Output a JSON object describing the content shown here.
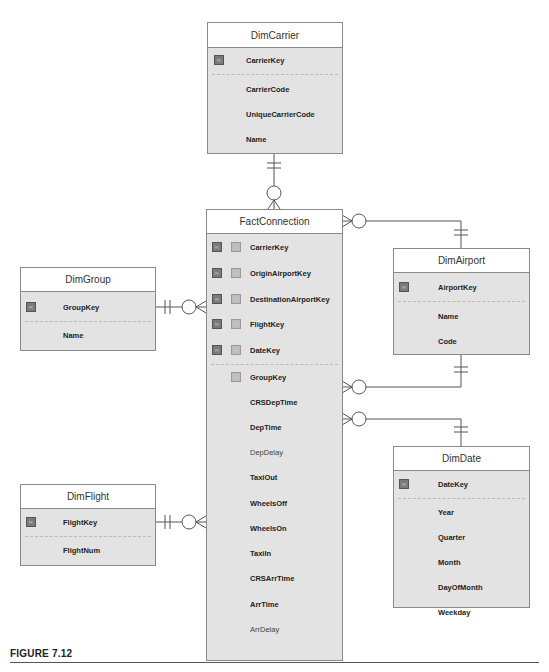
{
  "entities": {
    "dimcarrier": {
      "title": "DimCarrier",
      "fields": [
        {
          "name": "CarrierKey",
          "badge": "PK"
        },
        {
          "name": "CarrierCode"
        },
        {
          "name": "UniqueCarrierCode"
        },
        {
          "name": "Name"
        }
      ]
    },
    "factconnection": {
      "title": "FactConnection",
      "fields": [
        {
          "name": "CarrierKey",
          "badges": [
            "PK",
            "FK"
          ]
        },
        {
          "name": "OriginAirportKey",
          "badges": [
            "PK",
            "FK"
          ]
        },
        {
          "name": "DestinationAirportKey",
          "badges": [
            "PK",
            "FK"
          ]
        },
        {
          "name": "FlightKey",
          "badges": [
            "PK",
            "FK"
          ]
        },
        {
          "name": "DateKey",
          "badges": [
            "PK",
            "FK"
          ]
        },
        {
          "name": "GroupKey",
          "badges": [
            "FK"
          ]
        },
        {
          "name": "CRSDepTime"
        },
        {
          "name": "DepTime"
        },
        {
          "name": "DepDelay"
        },
        {
          "name": "TaxiOut"
        },
        {
          "name": "WheelsOff"
        },
        {
          "name": "WheelsOn"
        },
        {
          "name": "TaxiIn"
        },
        {
          "name": "CRSArrTime"
        },
        {
          "name": "ArrTime"
        },
        {
          "name": "ArrDelay"
        }
      ]
    },
    "dimgroup": {
      "title": "DimGroup",
      "fields": [
        {
          "name": "GroupKey",
          "badge": "PK"
        },
        {
          "name": "Name"
        }
      ]
    },
    "dimflight": {
      "title": "DimFlight",
      "fields": [
        {
          "name": "FlightKey",
          "badge": "PK"
        },
        {
          "name": "FlightNum"
        }
      ]
    },
    "dimairport": {
      "title": "DimAirport",
      "fields": [
        {
          "name": "AirportKey",
          "badge": "PK"
        },
        {
          "name": "Name"
        },
        {
          "name": "Code"
        }
      ]
    },
    "dimdate": {
      "title": "DimDate",
      "fields": [
        {
          "name": "DateKey",
          "badge": "PK"
        },
        {
          "name": "Year"
        },
        {
          "name": "Quarter"
        },
        {
          "name": "Month"
        },
        {
          "name": "DayOfMonth"
        },
        {
          "name": "Weekday"
        }
      ]
    }
  },
  "relationships": [
    {
      "from": "DimCarrier",
      "to": "FactConnection",
      "cardinality": "one-and-only-one to zero-or-many"
    },
    {
      "from": "DimGroup",
      "to": "FactConnection",
      "cardinality": "one-and-only-one to zero-or-many"
    },
    {
      "from": "DimFlight",
      "to": "FactConnection",
      "cardinality": "one-and-only-one to zero-or-many"
    },
    {
      "from": "DimAirport",
      "to": "FactConnection",
      "cardinality": "one-and-only-one to zero-or-many (origin)"
    },
    {
      "from": "DimAirport",
      "to": "FactConnection",
      "cardinality": "one-and-only-one to zero-or-many (destination)"
    },
    {
      "from": "DimDate",
      "to": "FactConnection",
      "cardinality": "one-and-only-one to zero-or-many"
    }
  ],
  "caption": "FIGURE 7.12"
}
